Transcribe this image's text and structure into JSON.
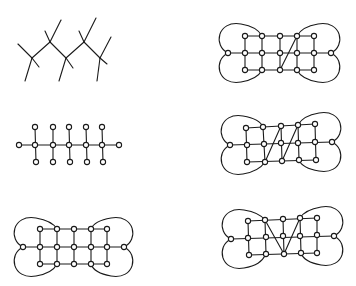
{
  "figure": {
    "panels": [
      {
        "id": "tree",
        "kind": "tree",
        "nodes": [],
        "edges": [
          [
            32,
            58,
            18,
            44
          ],
          [
            32,
            58,
            39,
            67
          ],
          [
            32,
            58,
            25,
            81
          ],
          [
            32,
            58,
            50,
            42
          ],
          [
            50,
            42,
            45,
            31
          ],
          [
            50,
            42,
            61,
            20
          ],
          [
            50,
            42,
            66,
            58
          ],
          [
            66,
            58,
            73,
            68
          ],
          [
            66,
            58,
            59,
            81
          ],
          [
            66,
            58,
            84,
            42
          ],
          [
            84,
            42,
            79,
            31
          ],
          [
            84,
            42,
            96,
            18
          ],
          [
            84,
            42,
            100,
            58
          ],
          [
            100,
            58,
            107,
            64
          ],
          [
            100,
            58,
            97,
            81
          ],
          [
            100,
            58,
            111,
            37
          ]
        ],
        "loops": []
      },
      {
        "id": "comb",
        "kind": "graph",
        "nodes": [
          [
            19,
            145
          ],
          [
            35,
            145
          ],
          [
            53,
            145
          ],
          [
            69,
            145
          ],
          [
            86,
            145
          ],
          [
            102,
            145
          ],
          [
            119,
            145
          ],
          [
            35,
            127
          ],
          [
            53,
            127
          ],
          [
            69,
            127
          ],
          [
            86,
            127
          ],
          [
            102,
            127
          ],
          [
            36,
            162
          ],
          [
            53,
            162
          ],
          [
            70,
            162
          ],
          [
            87,
            162
          ],
          [
            103,
            162
          ]
        ],
        "edges": [
          [
            19,
            145,
            119,
            145
          ],
          [
            35,
            127,
            36,
            162
          ],
          [
            53,
            127,
            53,
            162
          ],
          [
            69,
            127,
            70,
            162
          ],
          [
            86,
            127,
            87,
            162
          ],
          [
            102,
            127,
            103,
            162
          ]
        ],
        "loops": []
      },
      {
        "id": "grid-plain",
        "kind": "graph",
        "nodes": [
          [
            40,
            229
          ],
          [
            57,
            229
          ],
          [
            74,
            229
          ],
          [
            91,
            229
          ],
          [
            107,
            229
          ],
          [
            23,
            247
          ],
          [
            40,
            247
          ],
          [
            57,
            247
          ],
          [
            74,
            247
          ],
          [
            91,
            247
          ],
          [
            107,
            247
          ],
          [
            124,
            247
          ],
          [
            40,
            264
          ],
          [
            57,
            264
          ],
          [
            74,
            264
          ],
          [
            91,
            264
          ],
          [
            107,
            264
          ]
        ],
        "edges": [
          [
            40,
            229,
            107,
            229
          ],
          [
            23,
            247,
            124,
            247
          ],
          [
            40,
            264,
            107,
            264
          ],
          [
            40,
            229,
            40,
            264
          ],
          [
            57,
            229,
            57,
            264
          ],
          [
            74,
            229,
            74,
            264
          ],
          [
            91,
            229,
            91,
            264
          ],
          [
            107,
            229,
            107,
            264
          ]
        ],
        "loops": [
          "M23,247 C8,240 12,214 36,218 C48,220 54,224 57,229",
          "M23,247 C8,254 12,280 36,276 C48,274 54,270 57,264",
          "M124,247 C139,240 135,214 111,218 C99,220 93,224 91,229",
          "M124,247 C139,254 135,280 111,276 C99,274 93,270 91,264"
        ]
      },
      {
        "id": "grid-one-diagonal",
        "kind": "graph",
        "nodes": [
          [
            245,
            36
          ],
          [
            262,
            36
          ],
          [
            280,
            36
          ],
          [
            297,
            36
          ],
          [
            314,
            36
          ],
          [
            228,
            53
          ],
          [
            245,
            53
          ],
          [
            262,
            53
          ],
          [
            280,
            53
          ],
          [
            297,
            53
          ],
          [
            314,
            53
          ],
          [
            331,
            53
          ],
          [
            245,
            70
          ],
          [
            262,
            70
          ],
          [
            280,
            70
          ],
          [
            297,
            70
          ],
          [
            314,
            70
          ]
        ],
        "edges": [
          [
            245,
            36,
            314,
            36
          ],
          [
            228,
            53,
            331,
            53
          ],
          [
            245,
            70,
            314,
            70
          ],
          [
            245,
            36,
            245,
            70
          ],
          [
            262,
            36,
            262,
            70
          ],
          [
            280,
            36,
            280,
            70
          ],
          [
            297,
            36,
            297,
            70
          ],
          [
            314,
            36,
            314,
            70
          ],
          [
            297,
            36,
            280,
            70
          ]
        ],
        "loops": [
          "M228,53 C213,46 217,20 241,24 C253,26 259,30 262,36",
          "M228,53 C213,60 217,86 241,82 C253,80 259,76 262,70",
          "M331,53 C346,46 342,20 318,24 C306,26 300,30 297,36",
          "M331,53 C346,60 342,86 318,82 C306,80 300,76 297,70"
        ]
      },
      {
        "id": "grid-two-diagonals",
        "kind": "graph",
        "nodes": [
          [
            246,
            128
          ],
          [
            263,
            127
          ],
          [
            281,
            126
          ],
          [
            298,
            125
          ],
          [
            315,
            124
          ],
          [
            230,
            145
          ],
          [
            247,
            145
          ],
          [
            264,
            144
          ],
          [
            281,
            143
          ],
          [
            298,
            143
          ],
          [
            315,
            142
          ],
          [
            332,
            142
          ],
          [
            247,
            162
          ],
          [
            265,
            162
          ],
          [
            282,
            161
          ],
          [
            299,
            160
          ],
          [
            316,
            160
          ]
        ],
        "edges": [
          [
            246,
            128,
            315,
            124
          ],
          [
            230,
            145,
            332,
            142
          ],
          [
            247,
            162,
            316,
            160
          ],
          [
            246,
            128,
            247,
            162
          ],
          [
            263,
            127,
            265,
            162
          ],
          [
            281,
            126,
            282,
            161
          ],
          [
            298,
            125,
            299,
            160
          ],
          [
            315,
            124,
            316,
            160
          ],
          [
            281,
            126,
            265,
            162
          ],
          [
            298,
            125,
            282,
            161
          ]
        ],
        "loops": [
          "M230,145 C215,138 219,112 243,116 C255,118 261,122 263,127",
          "M230,145 C215,152 219,178 243,174 C255,172 261,168 265,162",
          "M332,142 C347,135 343,109 319,113 C307,115 301,119 298,125",
          "M332,142 C347,149 343,175 319,171 C307,169 301,165 299,160"
        ]
      },
      {
        "id": "grid-v-shape",
        "kind": "graph",
        "nodes": [
          [
            248,
            221
          ],
          [
            265,
            220
          ],
          [
            283,
            219
          ],
          [
            300,
            218
          ],
          [
            317,
            218
          ],
          [
            231,
            239
          ],
          [
            248,
            238
          ],
          [
            266,
            237
          ],
          [
            283,
            236
          ],
          [
            300,
            236
          ],
          [
            317,
            235
          ],
          [
            334,
            236
          ],
          [
            249,
            255
          ],
          [
            266,
            254
          ],
          [
            284,
            254
          ],
          [
            301,
            253
          ],
          [
            317,
            253
          ]
        ],
        "edges": [
          [
            248,
            221,
            317,
            218
          ],
          [
            231,
            239,
            334,
            236
          ],
          [
            249,
            255,
            317,
            253
          ],
          [
            248,
            221,
            249,
            255
          ],
          [
            265,
            220,
            266,
            254
          ],
          [
            283,
            219,
            284,
            254
          ],
          [
            300,
            218,
            301,
            253
          ],
          [
            317,
            218,
            317,
            253
          ],
          [
            265,
            220,
            284,
            254
          ],
          [
            300,
            218,
            284,
            254
          ]
        ],
        "loops": [
          "M231,239 C216,232 220,206 244,210 C256,212 262,216 265,220",
          "M231,239 C216,246 220,272 244,268 C256,266 262,262 266,254",
          "M334,236 C349,229 345,203 321,207 C309,209 303,213 300,218",
          "M334,236 C349,243 345,269 321,265 C309,263 303,259 301,253"
        ]
      }
    ],
    "node_radius": 2.6,
    "colors": {
      "stroke": "#1a1a1a",
      "node_fill": "#ffffff",
      "background": "#ffffff"
    }
  }
}
